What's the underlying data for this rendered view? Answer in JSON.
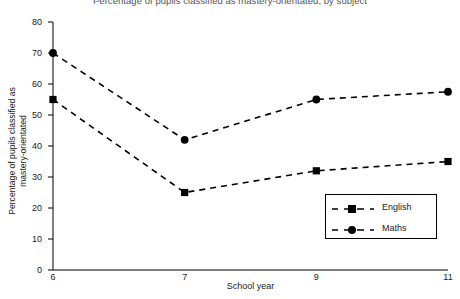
{
  "chart_data": {
    "type": "line",
    "title": "Percentage of pupils classified as mastery-orientated, by subject",
    "xlabel": "School year",
    "ylabel_line1": "Percentage of pupils classified as",
    "ylabel_line2": "mastery-orientated",
    "categories": [
      "6",
      "7",
      "9",
      "11"
    ],
    "xtick_labels": [
      "6",
      "7",
      "9",
      "11"
    ],
    "ytick_labels": [
      "0",
      "10",
      "20",
      "30",
      "40",
      "50",
      "60",
      "70",
      "80"
    ],
    "yticks": [
      0,
      10,
      20,
      30,
      40,
      50,
      60,
      70,
      80
    ],
    "ylim": [
      0,
      80
    ],
    "grid": false,
    "legend_position": "inside-lower-right",
    "series": [
      {
        "name": "English",
        "marker": "square",
        "linestyle": "dashed",
        "color": "#000000",
        "values": [
          55,
          25,
          32,
          35
        ]
      },
      {
        "name": "Maths",
        "marker": "circle",
        "linestyle": "dashed",
        "color": "#000000",
        "values": [
          70,
          42,
          55,
          57.5
        ]
      }
    ]
  },
  "legend": {
    "items": [
      {
        "label": "English"
      },
      {
        "label": "Maths"
      }
    ]
  }
}
